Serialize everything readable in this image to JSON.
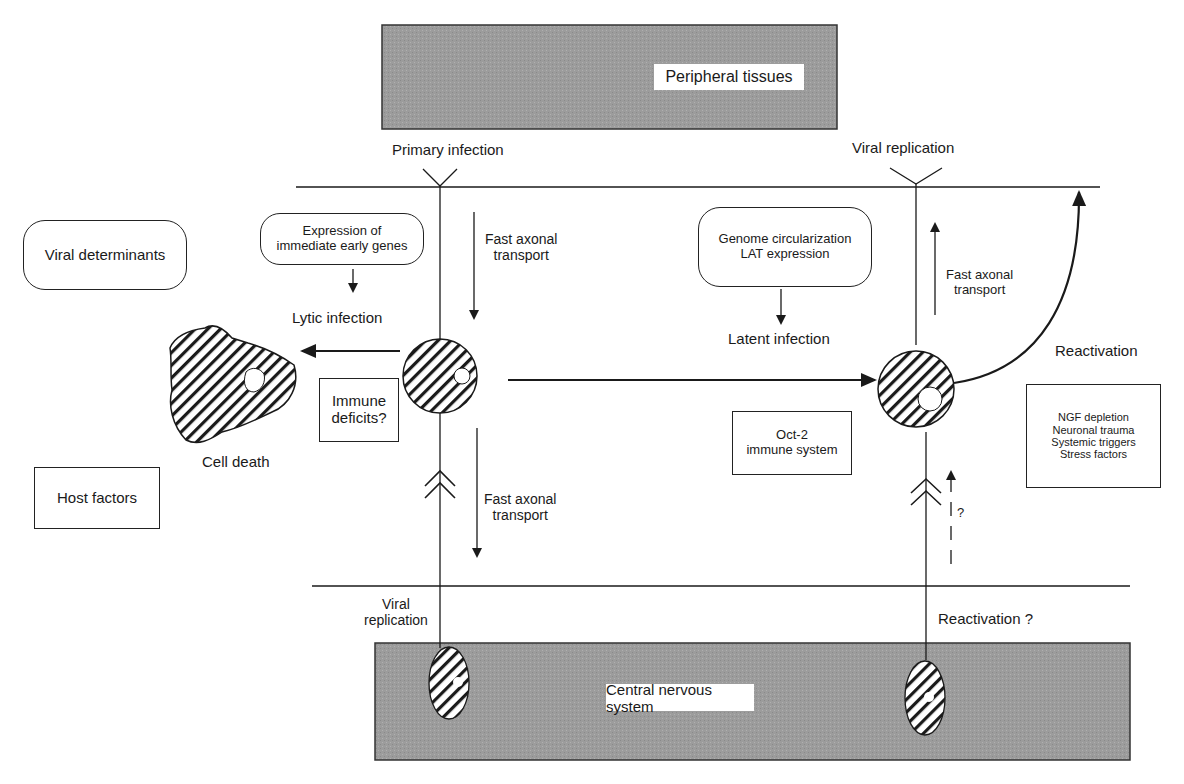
{
  "bands": {
    "top": {
      "label": "Peripheral tissues",
      "fill": "#9a9a9a"
    },
    "bottom": {
      "label": "Central nervous system",
      "fill": "#9a9a9a"
    }
  },
  "top_labels": {
    "primary_infection": "Primary infection",
    "viral_replication": "Viral replication"
  },
  "left_panel": {
    "viral_determinants": "Viral determinants",
    "host_factors": "Host factors",
    "cell_death": "Cell death"
  },
  "lytic_path": {
    "ie_genes_line1": "Expression of",
    "ie_genes_line2": "immediate early genes",
    "lytic_infection": "Lytic infection",
    "immune_deficits_line1": "Immune",
    "immune_deficits_line2": "deficits?",
    "fast_axonal_down_top_1": "Fast axonal",
    "fast_axonal_down_top_2": "transport",
    "fast_axonal_down_bottom_1": "Fast axonal",
    "fast_axonal_down_bottom_2": "transport",
    "viral_replication_cns_1": "Viral",
    "viral_replication_cns_2": "replication"
  },
  "latent_path": {
    "genome_line1": "Genome circularization",
    "genome_line2": "LAT expression",
    "latent_infection": "Latent infection",
    "oct2_line1": "Oct-2",
    "oct2_line2": "immune system",
    "fast_axonal_up_1": "Fast axonal",
    "fast_axonal_up_2": "transport",
    "reactivation": "Reactivation",
    "question_mark": "?",
    "reactivation_cns": "Reactivation ?"
  },
  "triggers": {
    "items": [
      "NGF depletion",
      "Neuronal trauma",
      "Systemic triggers",
      "Stress factors"
    ]
  },
  "colors": {
    "line": "#1a1a1a",
    "band_fill": "#9a9a9a",
    "hatch": "#1a1a1a"
  }
}
